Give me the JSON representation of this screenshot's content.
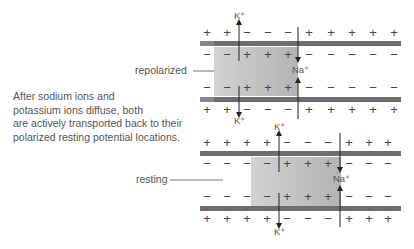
{
  "caption": {
    "lines": [
      "After sodium ions and",
      "potassium ions diffuse, both",
      "are actively transported back to their",
      "polarized resting potential locations."
    ]
  },
  "labels": {
    "repolarized": "repolarized",
    "resting": "resting"
  },
  "ions": {
    "potassium": "K⁺",
    "sodium": "Na⁺"
  },
  "colors": {
    "membrane": "#6e6e6e",
    "shaded_dark": "#b5b5b5",
    "shaded_light": "#cfcfcf",
    "text": "#555555"
  },
  "diagrams": [
    {
      "name": "repolarized",
      "outer_top": [
        "+",
        "+",
        "−",
        "−",
        "−",
        "+",
        "+",
        "+",
        "+",
        "+"
      ],
      "inner_top": [
        "−",
        "−",
        "+",
        "+",
        "+",
        "−",
        "−",
        "−",
        "−",
        "−"
      ],
      "inner_bottom": [
        "−",
        "−",
        "+",
        "+",
        "+",
        "−",
        "−",
        "−",
        "−",
        "−"
      ],
      "outer_bottom": [
        "+",
        "+",
        "−",
        "−",
        "−",
        "+",
        "+",
        "+",
        "+",
        "+"
      ]
    },
    {
      "name": "resting",
      "outer_top": [
        "+",
        "+",
        "+",
        "+",
        "−",
        "−",
        "−",
        "+",
        "+",
        "+"
      ],
      "inner_top": [
        "−",
        "−",
        "−",
        "−",
        "+",
        "+",
        "+",
        "−",
        "−",
        "−"
      ],
      "inner_bottom": [
        "−",
        "−",
        "−",
        "−",
        "+",
        "+",
        "+",
        "−",
        "−",
        "−"
      ],
      "outer_bottom": [
        "+",
        "+",
        "+",
        "+",
        "−",
        "−",
        "−",
        "+",
        "+",
        "+"
      ]
    }
  ]
}
